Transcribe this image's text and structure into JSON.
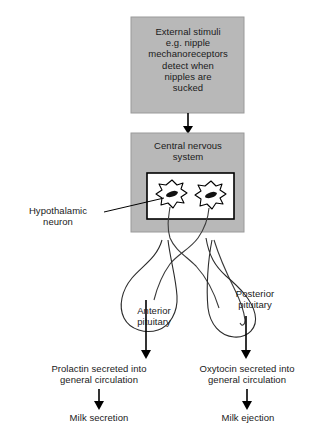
{
  "diagram": {
    "colors": {
      "box_fill": "#b8b8b8",
      "box_stroke": "#8f8f8f",
      "inner_fill": "#ffffff",
      "stroke": "#000000",
      "line": "#2b2b2b",
      "text": "#1a1a1a"
    },
    "boxes": [
      {
        "id": "external-stimuli",
        "label": "External stimuli\ne.g. nipple\nmechanoreceptors\ndetect when\nnipples are\nsucked",
        "x": 131,
        "y": 17,
        "w": 113,
        "h": 96
      },
      {
        "id": "central-nervous-system",
        "label": "Central nervous\nsystem",
        "x": 131,
        "y": 133,
        "w": 113,
        "h": 99
      }
    ],
    "inner_box": {
      "x": 147,
      "y": 173,
      "w": 87,
      "h": 46
    },
    "neurons": [
      {
        "id": "neuron-left",
        "cx": 172,
        "cy": 195
      },
      {
        "id": "neuron-right",
        "cx": 211,
        "cy": 196
      }
    ],
    "labels": {
      "hypothalamic_neuron": "Hypothalamic\nneuron",
      "anterior_pituitary": "Anterior\npituitary",
      "posterior_pituitary": "Posterior\npituitary",
      "prolactin": "Prolactin secreted into\ngeneral circulation",
      "oxytocin": "Oxytocin secreted into\ngeneral circulation",
      "milk_secretion": "Milk secretion",
      "milk_ejection": "Milk ejection"
    },
    "arrows": [
      {
        "id": "stimuli-to-cns",
        "x": 188,
        "from_y": 113,
        "to_y": 133
      },
      {
        "id": "anterior-to-prolactin",
        "x": 146,
        "from_y": 327,
        "to_y": 356
      },
      {
        "id": "posterior-to-oxytocin",
        "x": 246,
        "from_y": 325,
        "to_y": 356
      },
      {
        "id": "prolactin-to-milk-secretion",
        "x": 99,
        "from_y": 389,
        "to_y": 409
      },
      {
        "id": "oxytocin-to-milk-ejection",
        "x": 247,
        "from_y": 389,
        "to_y": 409
      }
    ]
  }
}
